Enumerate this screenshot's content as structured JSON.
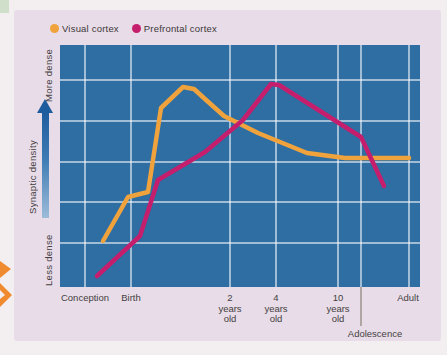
{
  "figure": {
    "type": "line chart",
    "background_card_color": "#e8dce8",
    "plot_background_color": "#2E6EA3"
  },
  "legend": {
    "items": [
      {
        "label": "Visual cortex",
        "color": "#F0A23C"
      },
      {
        "label": "Prefrontal cortex",
        "color": "#C41E6C"
      }
    ]
  },
  "y_axis": {
    "label": "Synaptic density",
    "top_label": "More dense",
    "bottom_label": "Less dense",
    "arrow": "upward blue gradient arrow"
  },
  "x_axis": {
    "labels": [
      {
        "text": "Conception",
        "x": 85
      },
      {
        "text": "Birth",
        "x": 131
      },
      {
        "text": "2\nyears\nold",
        "x": 230
      },
      {
        "text": "4\nyears\nold",
        "x": 276
      },
      {
        "text": "10\nyears\nold",
        "x": 338
      },
      {
        "text": "Adult",
        "x": 408
      }
    ]
  },
  "annotation": {
    "label": "Adolescence",
    "x": 361,
    "label_center_x": 375,
    "note": "vertical marker line through plot extending below axis"
  },
  "chart_data": {
    "type": "line",
    "title": "",
    "xlabel": "Age (Conception to Adult)",
    "ylabel": "Synaptic density",
    "y_scale": "qualitative, Less dense (0) to More dense (100)",
    "grid": true,
    "legend_position": "top",
    "series": [
      {
        "name": "Visual cortex",
        "color": "#F0A23C",
        "points_age_density": [
          {
            "age": "mid-gestation",
            "density": 19
          },
          {
            "age": "Birth",
            "density": 37
          },
          {
            "age": "shortly after birth",
            "density": 39
          },
          {
            "age": "~1 year (peak)",
            "density": 83
          },
          {
            "age": "2 years old",
            "density": 71
          },
          {
            "age": "4 years old",
            "density": 61
          },
          {
            "age": "10 years old",
            "density": 53
          },
          {
            "age": "Adult",
            "density": 53
          }
        ]
      },
      {
        "name": "Prefrontal cortex",
        "color": "#C41E6C",
        "points_age_density": [
          {
            "age": "mid-gestation",
            "density": 5
          },
          {
            "age": "Birth",
            "density": 21
          },
          {
            "age": "2 years old",
            "density": 64
          },
          {
            "age": "4 years old (peak)",
            "density": 84
          },
          {
            "age": "10 years old",
            "density": 68
          },
          {
            "age": "Adolescence",
            "density": 62
          },
          {
            "age": "Adult",
            "density": 42
          }
        ]
      }
    ],
    "render": {
      "plot": {
        "x": 60,
        "y": 45,
        "w": 360,
        "h": 242,
        "bg": "#2E6EA3"
      },
      "vgrid": [
        85,
        131,
        230,
        276,
        338,
        361,
        409
      ],
      "hgrid": [
        80,
        121,
        162,
        202,
        243
      ],
      "grid_color": "rgba(255,255,255,0.55)",
      "grid_width": 2,
      "annotation_line": {
        "x": 361,
        "y1": 287,
        "y2": 326,
        "color": "#8a8175"
      },
      "series_pixels": [
        {
          "name": "Visual cortex",
          "color": "#F0A23C",
          "width": 4.5,
          "points": [
            [
              103,
              241
            ],
            [
              128,
              197
            ],
            [
              148,
              192
            ],
            [
              161,
              108
            ],
            [
              183,
              87
            ],
            [
              194,
              89
            ],
            [
              205,
              99
            ],
            [
              224,
              116
            ],
            [
              258,
              133
            ],
            [
              307,
              153
            ],
            [
              345,
              158
            ],
            [
              409,
              158
            ]
          ]
        },
        {
          "name": "Prefrontal cortex",
          "color": "#C41E6C",
          "width": 4.5,
          "points": [
            [
              97,
              276
            ],
            [
              140,
              236
            ],
            [
              158,
              180
            ],
            [
              205,
              152
            ],
            [
              243,
              120
            ],
            [
              271,
              84
            ],
            [
              279,
              85
            ],
            [
              361,
              137
            ],
            [
              384,
              186
            ]
          ]
        }
      ]
    }
  }
}
